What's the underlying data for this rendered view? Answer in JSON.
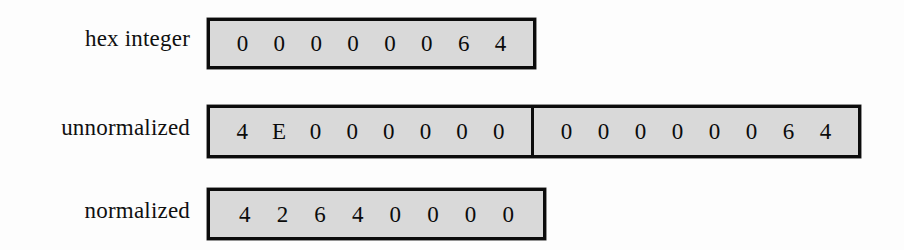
{
  "figure": {
    "background_color": "#fdfdfd",
    "box_fill_color": "#d9d9d9",
    "box_border_color": "#0c0c0c",
    "text_color": "#0b0b0b",
    "rows": [
      {
        "id": "hex-integer",
        "label": "hex integer",
        "segments": [
          {
            "id": "hex-integer-word",
            "digits": [
              "0",
              "0",
              "0",
              "0",
              "0",
              "0",
              "6",
              "4"
            ],
            "value": "00000064"
          }
        ]
      },
      {
        "id": "unnormalized",
        "label": "unnormalized",
        "segments": [
          {
            "id": "unnormalized-high-word",
            "digits": [
              "4",
              "E",
              "0",
              "0",
              "0",
              "0",
              "0",
              "0"
            ],
            "value": "4E000000"
          },
          {
            "id": "unnormalized-low-word",
            "digits": [
              "0",
              "0",
              "0",
              "0",
              "0",
              "0",
              "6",
              "4"
            ],
            "value": "00000064"
          }
        ]
      },
      {
        "id": "normalized",
        "label": "normalized",
        "segments": [
          {
            "id": "normalized-word",
            "digits": [
              "4",
              "2",
              "6",
              "4",
              "0",
              "0",
              "0",
              "0"
            ],
            "value": "42640000"
          }
        ]
      }
    ]
  }
}
